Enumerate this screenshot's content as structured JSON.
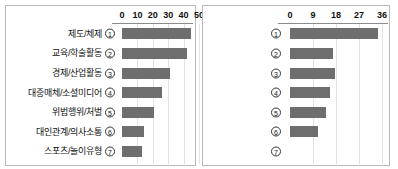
{
  "chart_data": [
    {
      "type": "bar",
      "orientation": "horizontal",
      "panel": "left",
      "title": "",
      "xlabel": "",
      "ylabel": "",
      "xlim": [
        0,
        50
      ],
      "xticks": [
        0,
        10,
        20,
        30,
        40,
        50
      ],
      "xtick_labels": [
        "0",
        "10",
        "20",
        "30",
        "40",
        "50"
      ],
      "grid": true,
      "legend": "none",
      "categories": [
        "제도/체제",
        "교육/학술활동",
        "경제/산업활동",
        "대중매체/소셜미디어",
        "위법행위/처벌",
        "대인관계/의사소통",
        "스포츠/놀이유형"
      ],
      "category_numbers": [
        "①",
        "②",
        "③",
        "④",
        "⑤",
        "⑥",
        "⑦"
      ],
      "values": [
        45,
        42,
        31,
        26,
        21,
        14,
        13
      ],
      "bar_color": "#6e6e6e"
    },
    {
      "type": "bar",
      "orientation": "horizontal",
      "panel": "right",
      "title": "",
      "xlabel": "",
      "ylabel": "",
      "xlim": [
        0,
        36
      ],
      "xticks": [
        0,
        9,
        18,
        27,
        36
      ],
      "xtick_labels": [
        "0",
        "9",
        "18",
        "27",
        "36"
      ],
      "grid": true,
      "legend": "none",
      "categories": [
        "①",
        "②",
        "③",
        "④",
        "⑤",
        "⑥",
        "⑦"
      ],
      "category_numbers": [
        "①",
        "②",
        "③",
        "④",
        "⑤",
        "⑥",
        "⑦"
      ],
      "values": [
        34.5,
        17,
        17.5,
        15.5,
        14,
        11,
        0
      ],
      "bar_color": "#6e6e6e"
    }
  ],
  "colors": {
    "bar": "#6e6e6e",
    "grid": "#e2e2e2",
    "border": "#b9b9b9",
    "axis": "#8c8c8c",
    "text": "#111111"
  }
}
